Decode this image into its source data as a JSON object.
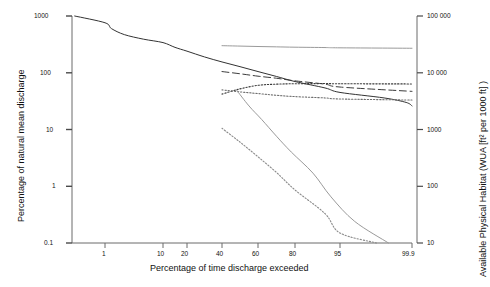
{
  "chart_data": {
    "type": "line",
    "title": "",
    "xlabel": "Percentage of time discharge exceeded",
    "ylabel": "Percentage of natural mean discharge",
    "y2label": "Available Physical Habitat (WUA [ft² per 1000 ft] )",
    "grid": false,
    "legend": "none",
    "x_scale": "probability",
    "y_scale": "log",
    "y2_scale": "log",
    "xticks": [
      "1",
      "10",
      "20",
      "40",
      "60",
      "80",
      "95",
      "99.9"
    ],
    "xtick_values": [
      1,
      10,
      20,
      40,
      60,
      80,
      95,
      99.9
    ],
    "yticks": [
      "1000",
      "100",
      "10",
      "1",
      "0.1"
    ],
    "ytick_values": [
      1000,
      100,
      10,
      1,
      0.1
    ],
    "ylim": [
      0.1,
      1000
    ],
    "y2ticks": [
      "100 000",
      "10 000",
      "1000",
      "100",
      "10"
    ],
    "y2tick_values": [
      100000,
      10000,
      1000,
      100,
      10
    ],
    "y2lim": [
      10,
      100000
    ],
    "series": [
      {
        "name": "flow-duration-curve",
        "axis": "left",
        "style": "solid",
        "color": "#333333",
        "x": [
          0.3,
          1,
          2,
          4,
          7,
          10,
          15,
          20,
          30,
          40,
          50,
          60,
          70,
          80,
          90,
          95,
          98,
          99.5,
          99.9
        ],
        "values": [
          1000,
          760,
          600,
          470,
          390,
          340,
          280,
          240,
          190,
          155,
          128,
          105,
          86,
          70,
          54,
          45,
          36,
          30,
          26
        ]
      },
      {
        "name": "habitat-curve-flat-top",
        "axis": "right",
        "style": "solid",
        "color": "#9a9a9a",
        "x": [
          40,
          50,
          60,
          70,
          80,
          90,
          95,
          99.9
        ],
        "values": [
          30000,
          29500,
          29000,
          28600,
          28200,
          27800,
          27500,
          27000
        ]
      },
      {
        "name": "habitat-curve-dashed",
        "axis": "right",
        "style": "dashed",
        "color": "#3b3b3b",
        "x": [
          40,
          50,
          60,
          70,
          80,
          90,
          95,
          99.9
        ],
        "values": [
          10500,
          9600,
          8700,
          8000,
          7200,
          6300,
          5600,
          4700
        ]
      },
      {
        "name": "habitat-curve-dotted-rising",
        "axis": "right",
        "style": "dotted",
        "color": "#3b3b3b",
        "x": [
          40,
          50,
          60,
          70,
          80,
          90,
          95,
          99.9
        ],
        "values": [
          4200,
          5200,
          6000,
          6300,
          6400,
          6450,
          6400,
          6350
        ]
      },
      {
        "name": "habitat-curve-dotted-falling",
        "axis": "right",
        "style": "dotted",
        "color": "#6e6e6e",
        "x": [
          40,
          50,
          60,
          70,
          80,
          90,
          95,
          99.9
        ],
        "values": [
          5000,
          4600,
          4300,
          4000,
          3800,
          3600,
          3450,
          3300
        ]
      },
      {
        "name": "habitat-curve-steep-dotted",
        "axis": "right",
        "style": "dotted",
        "color": "#8a8a8a",
        "x": [
          40,
          50,
          60,
          70,
          80,
          90,
          95,
          97.5
        ],
        "values": [
          1050,
          600,
          330,
          175,
          86,
          33,
          15,
          10
        ]
      },
      {
        "name": "habitat-curve-steep-solid",
        "axis": "right",
        "style": "solid",
        "color": "#9a9a9a",
        "x": [
          48,
          55,
          62,
          70,
          78,
          86,
          92,
          96,
          98.3
        ],
        "values": [
          5000,
          2600,
          1500,
          760,
          400,
          170,
          65,
          24,
          10
        ]
      }
    ]
  }
}
